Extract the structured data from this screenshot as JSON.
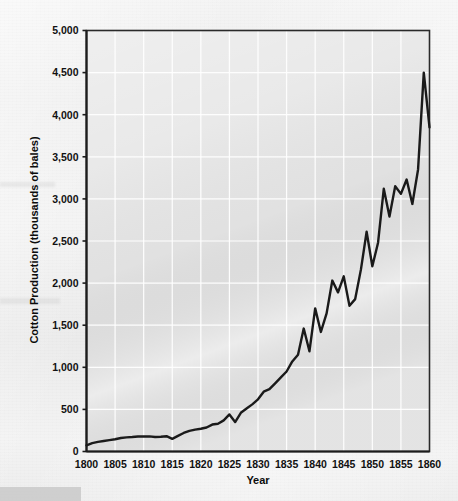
{
  "chart_data": {
    "type": "line",
    "title": "",
    "xlabel": "Year",
    "ylabel": "Cotton Production (thousands of bales)",
    "xlim": [
      1800,
      1860
    ],
    "ylim": [
      0,
      5000
    ],
    "xticks": [
      1800,
      1805,
      1810,
      1815,
      1820,
      1825,
      1830,
      1835,
      1840,
      1845,
      1850,
      1855,
      1860
    ],
    "xtick_labels": [
      "1800",
      "1805",
      "1810",
      "1815",
      "1820",
      "1825",
      "1830",
      "1835",
      "1840",
      "1845",
      "1850",
      "1855",
      "1860"
    ],
    "yticks": [
      0,
      500,
      1000,
      1500,
      2000,
      2500,
      3000,
      3500,
      4000,
      4500,
      5000
    ],
    "ytick_labels": [
      "0",
      "500",
      "1,000",
      "1,500",
      "2,000",
      "2,500",
      "3,000",
      "3,500",
      "4,000",
      "4,500",
      "5,000"
    ],
    "grid": true,
    "grid_color": "#ffffff",
    "plot_background": "#e8e8e8",
    "line_color": "#1a1a1a",
    "line_width": 2.4,
    "legend": null,
    "series": [
      {
        "name": "Cotton Production",
        "x": [
          1800,
          1801,
          1802,
          1803,
          1804,
          1805,
          1806,
          1807,
          1808,
          1809,
          1810,
          1811,
          1812,
          1813,
          1814,
          1815,
          1816,
          1817,
          1818,
          1819,
          1820,
          1821,
          1822,
          1823,
          1824,
          1825,
          1826,
          1827,
          1828,
          1829,
          1830,
          1831,
          1832,
          1833,
          1834,
          1835,
          1836,
          1837,
          1838,
          1839,
          1840,
          1841,
          1842,
          1843,
          1844,
          1845,
          1846,
          1847,
          1848,
          1849,
          1850,
          1851,
          1852,
          1853,
          1854,
          1855,
          1856,
          1857,
          1858,
          1859,
          1860
        ],
        "values": [
          73,
          100,
          115,
          125,
          135,
          146,
          160,
          168,
          172,
          178,
          178,
          180,
          172,
          176,
          182,
          150,
          185,
          220,
          245,
          260,
          270,
          285,
          320,
          330,
          370,
          440,
          350,
          460,
          510,
          560,
          620,
          710,
          740,
          810,
          880,
          950,
          1070,
          1150,
          1460,
          1190,
          1700,
          1420,
          1640,
          2030,
          1890,
          2080,
          1730,
          1810,
          2160,
          2610,
          2200,
          2480,
          3120,
          2790,
          3150,
          3060,
          3230,
          2940,
          3350,
          4500,
          3850
        ]
      }
    ]
  },
  "axis": {
    "y_label": "Cotton Production (thousands of bales)",
    "x_label": "Year"
  }
}
